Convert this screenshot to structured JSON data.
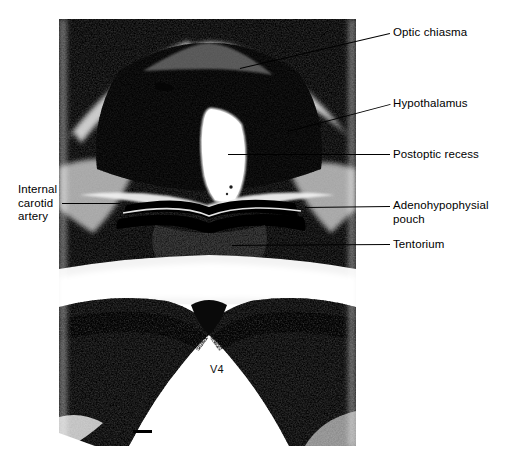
{
  "figure": {
    "kind": "histological-micrograph",
    "background_color": "#ffffff",
    "ink_color": "#000000",
    "plate": {
      "x": 59,
      "y": 19,
      "width": 297,
      "height": 427,
      "tone": "grayscale halftone"
    }
  },
  "annotations": [
    {
      "id": "optic-chiasma",
      "label": "Optic chiasma",
      "side": "right",
      "label_x": 393,
      "label_y": 26,
      "leader": {
        "x1": 240,
        "y1": 68,
        "x2": 390,
        "y2": 33
      }
    },
    {
      "id": "hypothalamus",
      "label": "Hypothalamus",
      "side": "right",
      "label_x": 393,
      "label_y": 97,
      "leader": {
        "x1": 288,
        "y1": 131,
        "x2": 390,
        "y2": 104
      }
    },
    {
      "id": "postoptic-recess",
      "label": "Postoptic recess",
      "side": "right",
      "label_x": 393,
      "label_y": 148,
      "leader": {
        "x1": 228,
        "y1": 154,
        "x2": 390,
        "y2": 154
      }
    },
    {
      "id": "adenohypophysial-pouch",
      "label": "Adenohypophysial\npouch",
      "side": "right",
      "label_x": 393,
      "label_y": 199,
      "leader": {
        "x1": 305,
        "y1": 207,
        "x2": 390,
        "y2": 206
      }
    },
    {
      "id": "tentorium",
      "label": "Tentorium",
      "side": "right",
      "label_x": 393,
      "label_y": 238,
      "leader": {
        "x1": 232,
        "y1": 245,
        "x2": 390,
        "y2": 244
      }
    },
    {
      "id": "internal-carotid-artery",
      "label": "Internal\ncarotid\nartery",
      "side": "left",
      "label_x": 18,
      "label_y": 183,
      "leader": {
        "x1": 62,
        "y1": 203,
        "x2": 120,
        "y2": 203
      }
    }
  ],
  "in_image": {
    "ventricle_label": "V4",
    "ventricle_label_x": 210,
    "ventricle_label_y": 363,
    "scale_bar": {
      "x": 133,
      "y": 430,
      "width": 19,
      "height": 3
    }
  }
}
